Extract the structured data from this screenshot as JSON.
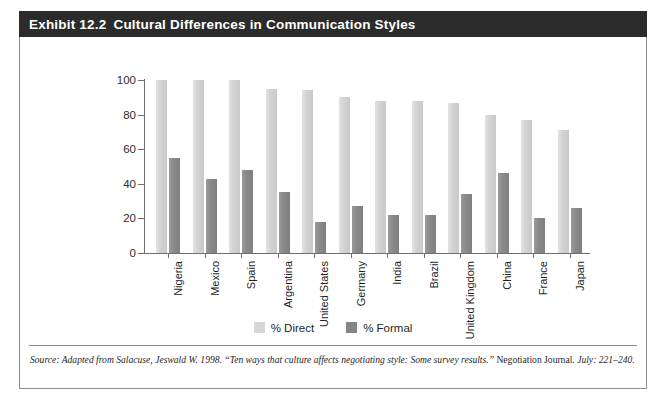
{
  "exhibit": {
    "number": "Exhibit 12.2",
    "title": "Cultural Differences in Communication Styles"
  },
  "source": {
    "lead": "Source: Adapted from Salacuse, Jeswald W. 1998. “Ten ways that culture affects negotiating style: Some survey results.” ",
    "journal": "Negotiation Journal.",
    "tail": " July: 221–240."
  },
  "colors": {
    "header_bg": "#2b2b2b",
    "header_text": "#ffffff",
    "direct_bar": "#d6d6d6",
    "formal_bar": "#868686",
    "axis": "#6f6f6f",
    "border": "#8d8d8d"
  },
  "chart_data": {
    "type": "bar",
    "title": "Cultural Differences in Communication Styles",
    "xlabel": "",
    "ylabel": "",
    "ylim": [
      0,
      100
    ],
    "yticks": [
      0,
      20,
      40,
      60,
      80,
      100
    ],
    "grid": false,
    "legend_position": "bottom",
    "categories": [
      "Nigeria",
      "Mexico",
      "Spain",
      "Argentina",
      "United States",
      "Germany",
      "India",
      "Brazil",
      "United Kingdom",
      "China",
      "France",
      "Japan"
    ],
    "series": [
      {
        "name": "% Direct",
        "color": "#d6d6d6",
        "values": [
          100,
          100,
          100,
          95,
          94,
          90,
          88,
          88,
          87,
          80,
          77,
          71
        ]
      },
      {
        "name": "% Formal",
        "color": "#868686",
        "values": [
          55,
          43,
          48,
          35,
          18,
          27,
          22,
          22,
          34,
          46,
          20,
          26
        ]
      }
    ]
  }
}
